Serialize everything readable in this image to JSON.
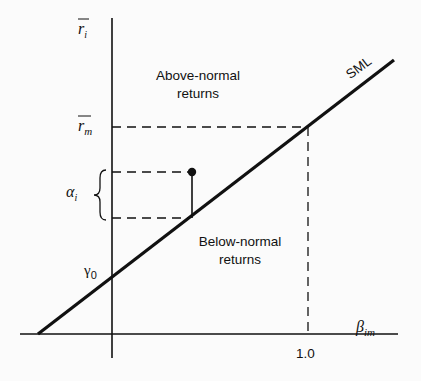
{
  "diagram": {
    "y_axis_label": "r̄i",
    "x_axis_label": "βim",
    "line_label": "SML",
    "rm_label": "r̄m",
    "gamma_label": "γ0",
    "alpha_label": "αi",
    "x_tick_label": "1.0",
    "region_above_line1": "Above-normal",
    "region_above_line2": "returns",
    "region_below_line1": "Below-normal",
    "region_below_line2": "returns",
    "colors": {
      "ink": "#111111",
      "background": "#fbfbfb"
    }
  }
}
